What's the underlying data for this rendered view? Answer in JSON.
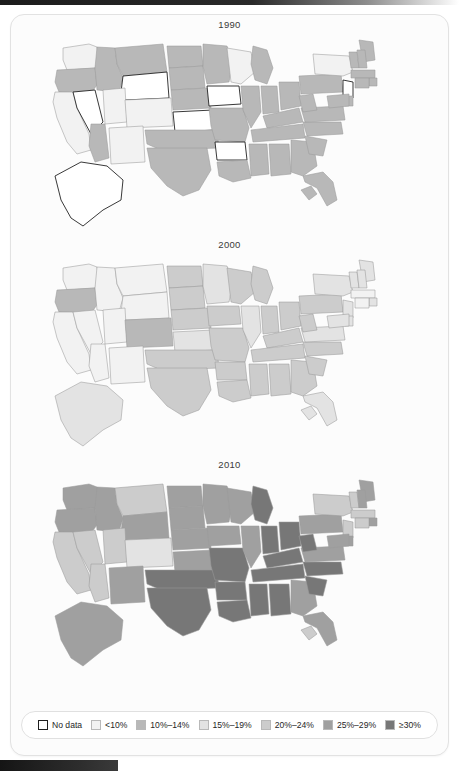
{
  "figure": {
    "caption_title": "",
    "panels": [
      {
        "year_label": "1990"
      },
      {
        "year_label": "2000"
      },
      {
        "year_label": "2010"
      }
    ]
  },
  "legend": {
    "items": [
      {
        "label": "No data",
        "color": "#ffffff",
        "key": "nodata"
      },
      {
        "label": "<10%",
        "color": "#f2f2f2",
        "key": "lt10"
      },
      {
        "label": "10%–14%",
        "color": "#b8b8b8",
        "key": "b10_14"
      },
      {
        "label": "15%–19%",
        "color": "#e3e3e3",
        "key": "b15_19"
      },
      {
        "label": "20%–24%",
        "color": "#cccccc",
        "key": "b20_24"
      },
      {
        "label": "25%–29%",
        "color": "#a0a0a0",
        "key": "b25_29"
      },
      {
        "label": "≥30%",
        "color": "#777777",
        "key": "ge30"
      }
    ]
  },
  "chart_data": {
    "type": "heatmap",
    "title": "",
    "subtitle": "",
    "xlabel": "",
    "ylabel": "",
    "map_projection": "usa-albers",
    "grid": false,
    "legend_position": "bottom",
    "categories": [
      "No data",
      "<10%",
      "10%–14%",
      "15%–19%",
      "20%–24%",
      "25%–29%",
      "≥30%"
    ],
    "category_colors": [
      "#ffffff",
      "#f2f2f2",
      "#b8b8b8",
      "#e3e3e3",
      "#cccccc",
      "#a0a0a0",
      "#777777"
    ],
    "panel_years": [
      "1990",
      "2000",
      "2010"
    ],
    "series": [
      {
        "name": "1990",
        "values": {
          "AL": "10%–14%",
          "AK": "No data",
          "AZ": "10%–14%",
          "AR": "No data",
          "CA": "<10%",
          "CO": "<10%",
          "CT": "10%–14%",
          "DE": "10%–14%",
          "FL": "10%–14%",
          "GA": "10%–14%",
          "HI": "10%–14%",
          "ID": "10%–14%",
          "IL": "10%–14%",
          "IN": "10%–14%",
          "IA": "No data",
          "KS": "No data",
          "KY": "10%–14%",
          "LA": "10%–14%",
          "ME": "10%–14%",
          "MD": "10%–14%",
          "MA": "10%–14%",
          "MI": "10%–14%",
          "MN": "10%–14%",
          "MS": "10%–14%",
          "MO": "10%–14%",
          "MT": "10%–14%",
          "NE": "10%–14%",
          "NV": "No data",
          "NH": "10%–14%",
          "NJ": "No data",
          "NM": "<10%",
          "NY": "<10%",
          "NC": "10%–14%",
          "ND": "10%–14%",
          "OH": "10%–14%",
          "OK": "10%–14%",
          "OR": "10%–14%",
          "PA": "10%–14%",
          "RI": "10%–14%",
          "SC": "10%–14%",
          "SD": "10%–14%",
          "TN": "10%–14%",
          "TX": "10%–14%",
          "UT": "<10%",
          "VT": "10%–14%",
          "VA": "10%–14%",
          "WA": "<10%",
          "WV": "10%–14%",
          "WI": "<10%",
          "WY": "No data"
        }
      },
      {
        "name": "2000",
        "values": {
          "AL": "20%–24%",
          "AK": "15%–19%",
          "AZ": "<10%",
          "AR": "20%–24%",
          "CA": "<10%",
          "CO": "10%–14%",
          "CT": "<10%",
          "DE": "15%–19%",
          "FL": "15%–19%",
          "GA": "20%–24%",
          "HI": "15%–19%",
          "ID": "<10%",
          "IL": "15%–19%",
          "IN": "20%–24%",
          "IA": "20%–24%",
          "KS": "15%–19%",
          "KY": "20%–24%",
          "LA": "20%–24%",
          "ME": "15%–19%",
          "MD": "15%–19%",
          "MA": "<10%",
          "MI": "20%–24%",
          "MN": "15%–19%",
          "MS": "20%–24%",
          "MO": "20%–24%",
          "MT": "<10%",
          "NE": "20%–24%",
          "NV": "<10%",
          "NH": "15%–19%",
          "NJ": "15%–19%",
          "NM": "<10%",
          "NY": "15%–19%",
          "NC": "20%–24%",
          "ND": "20%–24%",
          "OH": "20%–24%",
          "OK": "20%–24%",
          "OR": "10%–14%",
          "PA": "20%–24%",
          "RI": "15%–19%",
          "SC": "20%–24%",
          "SD": "20%–24%",
          "TN": "20%–24%",
          "TX": "20%–24%",
          "UT": "<10%",
          "VT": "15%–19%",
          "VA": "15%–19%",
          "WA": "<10%",
          "WV": "20%–24%",
          "WI": "20%–24%",
          "WY": "<10%"
        }
      },
      {
        "name": "2010",
        "values": {
          "AL": "≥30%",
          "AK": "25%–29%",
          "AZ": "20%–24%",
          "AR": "≥30%",
          "CA": "20%–24%",
          "CO": "15%–19%",
          "CT": "20%–24%",
          "DE": "25%–29%",
          "FL": "25%–29%",
          "GA": "25%–29%",
          "HI": "20%–24%",
          "ID": "25%–29%",
          "IL": "25%–29%",
          "IN": "≥30%",
          "IA": "25%–29%",
          "KS": "25%–29%",
          "KY": "≥30%",
          "LA": "≥30%",
          "ME": "25%–29%",
          "MD": "25%–29%",
          "MA": "20%–24%",
          "MI": "≥30%",
          "MN": "25%–29%",
          "MS": "≥30%",
          "MO": "≥30%",
          "MT": "20%–24%",
          "NE": "25%–29%",
          "NV": "20%–24%",
          "NH": "25%–29%",
          "NJ": "20%–24%",
          "NM": "25%–29%",
          "NY": "20%–24%",
          "NC": "≥30%",
          "ND": "25%–29%",
          "OH": "≥30%",
          "OK": "≥30%",
          "OR": "25%–29%",
          "PA": "25%–29%",
          "RI": "25%–29%",
          "SC": "≥30%",
          "SD": "25%–29%",
          "TN": "≥30%",
          "TX": "≥30%",
          "UT": "20%–24%",
          "VT": "20%–24%",
          "VA": "25%–29%",
          "WA": "25%–29%",
          "WV": "≥30%",
          "WI": "25%–29%",
          "WY": "25%–29%"
        }
      }
    ]
  }
}
